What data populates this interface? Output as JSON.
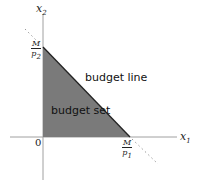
{
  "diagram": {
    "type": "budget-constraint",
    "x_axis_label": "x",
    "x_axis_sub": "1",
    "y_axis_label": "x",
    "y_axis_sub": "2",
    "origin_label": "0",
    "y_intercept": {
      "num": "M",
      "den": "p",
      "den_sub": "2"
    },
    "x_intercept": {
      "num": "M",
      "den": "p",
      "den_sub": "1"
    },
    "region_label": "budget set",
    "line_label": "budget line",
    "colors": {
      "fill": "#7a7a7a",
      "axis": "#a0a0a0",
      "line": "#222222",
      "dotted": "#9a9a9a"
    }
  }
}
